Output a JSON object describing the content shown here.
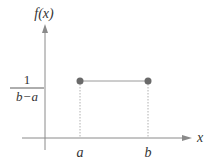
{
  "diagram": {
    "y_axis_label": "f(x)",
    "x_axis_label": "x",
    "height_label": {
      "numerator": "1",
      "denominator": "b−a"
    },
    "x_ticks": [
      {
        "label": "a"
      },
      {
        "label": "b"
      }
    ],
    "colors": {
      "axis": "#8a8a8a",
      "line": "#9a9a9a",
      "point": "#6a6a6a",
      "dotted": "#b0b0b0",
      "text": "#333333"
    }
  }
}
